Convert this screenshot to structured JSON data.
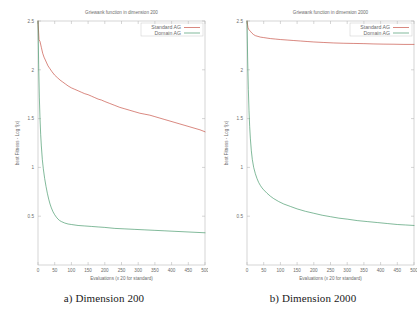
{
  "figure": {
    "caption_a": "a) Dimension 200",
    "caption_b": "b) Dimension 2000"
  },
  "colors": {
    "standard_ag": "#c0392b",
    "domain_ag": "#2e8b57",
    "axis": "#b9b9b9",
    "text": "#6b6b6b",
    "caption": "#1a1a1a",
    "background": "#ffffff"
  },
  "chart_data": [
    {
      "type": "line",
      "title": "Griewank function in dimension 200",
      "xlabel": "Evaluations (x 20 for standard)",
      "ylabel": "best Fitness - Log f(x)",
      "xlim": [
        0,
        500
      ],
      "ylim": [
        0,
        2.5
      ],
      "xticks": [
        0,
        50,
        100,
        150,
        200,
        250,
        300,
        350,
        400,
        450,
        500
      ],
      "yticks": [
        0.5,
        1,
        1.5,
        2,
        2.5
      ],
      "ytick_labels": [
        "0.5",
        "1",
        "1.5",
        "2",
        "2.5"
      ],
      "grid": false,
      "legend_position": "top-right",
      "series": [
        {
          "name": "Standard AG",
          "x": [
            0,
            3,
            6,
            10,
            14,
            18,
            22,
            26,
            30,
            36,
            42,
            50,
            58,
            66,
            74,
            82,
            90,
            100,
            110,
            120,
            130,
            140,
            150,
            160,
            170,
            180,
            190,
            200,
            215,
            230,
            245,
            260,
            275,
            290,
            305,
            320,
            335,
            350,
            365,
            380,
            395,
            410,
            425,
            440,
            455,
            470,
            485,
            500
          ],
          "values": [
            2.5,
            2.31,
            2.29,
            2.23,
            2.17,
            2.13,
            2.1,
            2.07,
            2.04,
            2.01,
            1.98,
            1.945,
            1.92,
            1.895,
            1.875,
            1.855,
            1.835,
            1.815,
            1.8,
            1.785,
            1.77,
            1.755,
            1.745,
            1.73,
            1.715,
            1.7,
            1.69,
            1.675,
            1.655,
            1.635,
            1.615,
            1.6,
            1.585,
            1.57,
            1.555,
            1.545,
            1.535,
            1.52,
            1.505,
            1.49,
            1.475,
            1.46,
            1.445,
            1.43,
            1.415,
            1.4,
            1.385,
            1.365
          ]
        },
        {
          "name": "Domain AG",
          "x": [
            0,
            2,
            4,
            6,
            8,
            10,
            13,
            16,
            20,
            24,
            28,
            32,
            36,
            40,
            45,
            50,
            55,
            60,
            65,
            70,
            80,
            90,
            100,
            120,
            140,
            160,
            180,
            200,
            230,
            260,
            290,
            320,
            350,
            380,
            410,
            440,
            470,
            500
          ],
          "values": [
            2.5,
            2.05,
            1.72,
            1.5,
            1.34,
            1.22,
            1.08,
            0.985,
            0.885,
            0.805,
            0.735,
            0.675,
            0.625,
            0.585,
            0.545,
            0.515,
            0.49,
            0.47,
            0.455,
            0.445,
            0.43,
            0.42,
            0.415,
            0.405,
            0.4,
            0.395,
            0.39,
            0.385,
            0.375,
            0.37,
            0.365,
            0.36,
            0.355,
            0.35,
            0.345,
            0.34,
            0.335,
            0.33
          ]
        }
      ]
    },
    {
      "type": "line",
      "title": "Griewank function in dimension 2000",
      "xlabel": "Evaluations (x 20 for standard)",
      "ylabel": "best Fitness - Log f(x)",
      "xlim": [
        0,
        500
      ],
      "ylim": [
        0,
        2.5
      ],
      "xticks": [
        0,
        50,
        100,
        150,
        200,
        250,
        300,
        350,
        400,
        450,
        500
      ],
      "yticks": [
        0.5,
        1,
        1.5,
        2,
        2.5
      ],
      "ytick_labels": [
        "0.5",
        "1",
        "1.5",
        "2",
        "2.5"
      ],
      "grid": false,
      "legend_position": "top-right",
      "series": [
        {
          "name": "Standard AG",
          "x": [
            0,
            3,
            6,
            10,
            15,
            20,
            25,
            30,
            40,
            50,
            60,
            70,
            85,
            100,
            120,
            140,
            160,
            180,
            200,
            230,
            260,
            290,
            320,
            350,
            380,
            410,
            440,
            470,
            500
          ],
          "values": [
            2.5,
            2.43,
            2.41,
            2.395,
            2.375,
            2.36,
            2.35,
            2.345,
            2.335,
            2.33,
            2.325,
            2.32,
            2.315,
            2.31,
            2.305,
            2.3,
            2.295,
            2.29,
            2.285,
            2.28,
            2.275,
            2.272,
            2.27,
            2.268,
            2.265,
            2.263,
            2.262,
            2.26,
            2.26
          ]
        },
        {
          "name": "Domain AG",
          "x": [
            0,
            2,
            4,
            6,
            8,
            10,
            13,
            16,
            20,
            25,
            30,
            35,
            40,
            45,
            50,
            60,
            70,
            80,
            95,
            110,
            130,
            150,
            175,
            200,
            225,
            250,
            275,
            300,
            330,
            360,
            390,
            420,
            450,
            475,
            500
          ],
          "values": [
            2.5,
            2.1,
            1.8,
            1.58,
            1.42,
            1.3,
            1.17,
            1.08,
            1.0,
            0.935,
            0.885,
            0.845,
            0.815,
            0.79,
            0.77,
            0.735,
            0.705,
            0.68,
            0.65,
            0.625,
            0.6,
            0.575,
            0.55,
            0.53,
            0.51,
            0.495,
            0.48,
            0.47,
            0.455,
            0.445,
            0.435,
            0.425,
            0.415,
            0.41,
            0.405
          ]
        }
      ]
    }
  ]
}
